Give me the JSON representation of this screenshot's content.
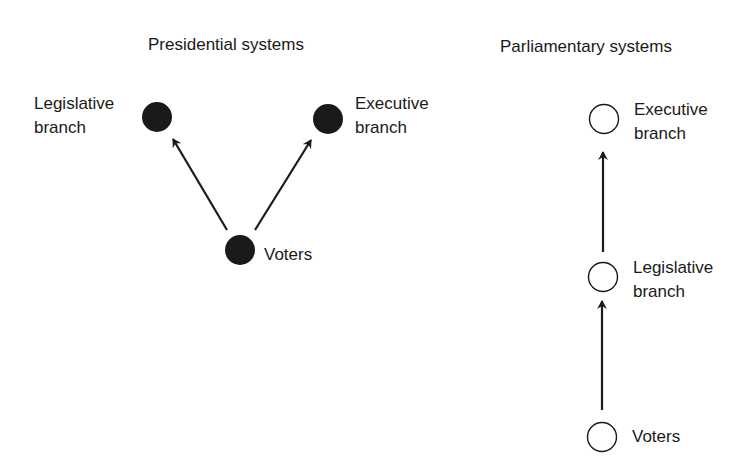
{
  "presidential": {
    "title": "Presidential systems",
    "nodes": {
      "legislative": {
        "line1": "Legislative",
        "line2": "branch",
        "fill": "#1a1a1a"
      },
      "executive": {
        "line1": "Executive",
        "line2": "branch",
        "fill": "#1a1a1a"
      },
      "voters": {
        "line1": "Voters",
        "fill": "#1a1a1a"
      }
    },
    "edges": [
      {
        "from": "voters",
        "to": "legislative"
      },
      {
        "from": "voters",
        "to": "executive"
      }
    ]
  },
  "parliamentary": {
    "title": "Parliamentary systems",
    "nodes": {
      "executive": {
        "line1": "Executive",
        "line2": "branch",
        "fill": "none"
      },
      "legislative": {
        "line1": "Legislative",
        "line2": "branch",
        "fill": "none"
      },
      "voters": {
        "line1": "Voters",
        "fill": "none"
      }
    },
    "edges": [
      {
        "from": "voters",
        "to": "legislative"
      },
      {
        "from": "legislative",
        "to": "executive"
      }
    ]
  },
  "colors": {
    "ink": "#1a1a1a",
    "background": "#ffffff"
  }
}
